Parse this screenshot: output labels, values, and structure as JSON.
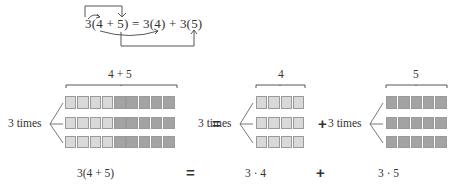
{
  "top_equation": {
    "text": "3(4 + 5) = 3(4) + 3(5)"
  },
  "groups": [
    {
      "brace_label": "4 + 5",
      "row_label": "3 times",
      "rows": 3,
      "light_cells": 4,
      "dark_cells": 5
    },
    {
      "brace_label": "4",
      "row_label": "3 times",
      "rows": 3,
      "light_cells": 4,
      "dark_cells": 0
    },
    {
      "brace_label": "5",
      "row_label": "3 times",
      "rows": 3,
      "light_cells": 0,
      "dark_cells": 5
    }
  ],
  "operators": {
    "equals": "=",
    "plus": "+"
  },
  "bottom_expressions": {
    "left": "3(4 + 5)",
    "equals": "=",
    "middle": "3 · 4",
    "plus": "+",
    "right": "3 · 5"
  },
  "colors": {
    "light": "#d9d9d9",
    "dark": "#a3a3a3",
    "line": "#555555"
  }
}
